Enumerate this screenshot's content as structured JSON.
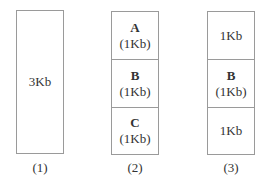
{
  "diagram": {
    "blocks": [
      {
        "caption": "(1)",
        "segments": [
          {
            "name": "",
            "size": "3Kb"
          }
        ]
      },
      {
        "caption": "(2)",
        "segments": [
          {
            "name": "A",
            "size": "(1Kb)"
          },
          {
            "name": "B",
            "size": "(1Kb)"
          },
          {
            "name": "C",
            "size": "(1Kb)"
          }
        ]
      },
      {
        "caption": "(3)",
        "segments": [
          {
            "name": "",
            "size": "1Kb"
          },
          {
            "name": "B",
            "size": "(1Kb)"
          },
          {
            "name": "",
            "size": "1Kb"
          }
        ]
      }
    ],
    "colors": {
      "border": "#9a9a9a",
      "text": "#333333",
      "background": "#ffffff"
    }
  }
}
